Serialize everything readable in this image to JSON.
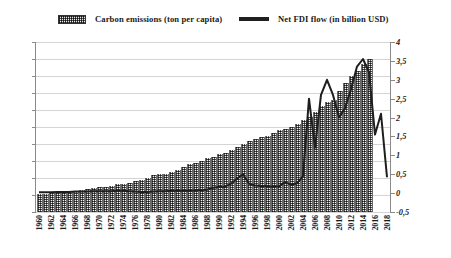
{
  "legend": {
    "bars_label": "Carbon emissions (ton per capita)",
    "line_label": "Net FDI flow (in billion USD)"
  },
  "axes": {
    "left_ticks": [
      "0",
      "0,2",
      "0,4",
      "0,6",
      "0,8",
      "1",
      "1,2",
      "1,4",
      "1,6",
      "1,8",
      "2"
    ],
    "right_ticks": [
      "-0,5",
      "0",
      "0,5",
      "1",
      "1,5",
      "2",
      "2,5",
      "3",
      "3,5",
      "4"
    ],
    "x_ticks": [
      "1960",
      "1962",
      "1964",
      "1966",
      "1968",
      "1970",
      "1972",
      "1974",
      "1976",
      "1978",
      "1980",
      "1982",
      "1984",
      "1986",
      "1988",
      "1990",
      "1992",
      "1994",
      "1996",
      "1998",
      "2000",
      "2002",
      "2004",
      "2006",
      "2008",
      "2010",
      "2012",
      "2014",
      "2016",
      "2018"
    ]
  },
  "colors": {
    "bar": "#5a5a5a",
    "line": "#1e1e1e",
    "grid": "#d4d4d4",
    "axis": "#8a8a8a",
    "text": "#1a1a1a"
  },
  "chart_data": {
    "type": "bar",
    "title": "",
    "subtitle": "",
    "xlabel": "",
    "ylabel": "",
    "grid": true,
    "legend_position": "top",
    "x": [
      1960,
      1961,
      1962,
      1963,
      1964,
      1965,
      1966,
      1967,
      1968,
      1969,
      1970,
      1971,
      1972,
      1973,
      1974,
      1975,
      1976,
      1977,
      1978,
      1979,
      1980,
      1981,
      1982,
      1983,
      1984,
      1985,
      1986,
      1987,
      1988,
      1989,
      1990,
      1991,
      1992,
      1993,
      1994,
      1995,
      1996,
      1997,
      1998,
      1999,
      2000,
      2001,
      2002,
      2003,
      2004,
      2005,
      2006,
      2007,
      2008,
      2009,
      2010,
      2011,
      2012,
      2013,
      2014,
      2015,
      2016,
      2017,
      2018
    ],
    "series": [
      {
        "name": "Carbon emissions (ton per capita)",
        "type": "bar",
        "axis": "left",
        "unit": "ton per capita",
        "ylim": [
          0,
          2
        ],
        "ytick_step": 0.2,
        "values": [
          0.21,
          0.21,
          0.22,
          0.22,
          0.23,
          0.23,
          0.25,
          0.26,
          0.27,
          0.28,
          0.3,
          0.3,
          0.31,
          0.33,
          0.33,
          0.34,
          0.36,
          0.38,
          0.4,
          0.43,
          0.45,
          0.45,
          0.47,
          0.5,
          0.53,
          0.56,
          0.58,
          0.6,
          0.63,
          0.65,
          0.68,
          0.7,
          0.73,
          0.76,
          0.8,
          0.83,
          0.86,
          0.88,
          0.9,
          0.93,
          0.96,
          0.98,
          1.0,
          1.03,
          1.08,
          1.12,
          1.18,
          1.25,
          1.3,
          1.32,
          1.42,
          1.52,
          1.6,
          1.66,
          1.74,
          1.8,
          null,
          null,
          null
        ]
      },
      {
        "name": "Net FDI flow (in billion USD)",
        "type": "line",
        "axis": "right",
        "unit": "billion USD",
        "ylim": [
          -0.5,
          4
        ],
        "ytick_step": 0.5,
        "values": [
          0.02,
          0.02,
          0.02,
          0.03,
          0.03,
          0.03,
          0.04,
          0.04,
          0.04,
          0.05,
          0.05,
          0.05,
          0.05,
          0.06,
          0.06,
          0.05,
          0.04,
          0.03,
          0.03,
          0.04,
          0.05,
          0.05,
          0.06,
          0.06,
          0.06,
          0.06,
          0.07,
          0.08,
          0.09,
          0.14,
          0.16,
          0.17,
          0.25,
          0.38,
          0.5,
          0.25,
          0.2,
          0.19,
          0.18,
          0.17,
          0.18,
          0.29,
          0.22,
          0.26,
          0.45,
          2.5,
          1.2,
          2.6,
          3.0,
          2.6,
          2.0,
          2.25,
          2.75,
          3.35,
          3.55,
          3.2,
          1.55,
          2.1,
          0.42
        ]
      }
    ]
  }
}
